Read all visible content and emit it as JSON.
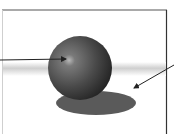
{
  "diagram": {
    "elements": [
      {
        "id": "sphere",
        "label": "",
        "type": "shaded sphere"
      },
      {
        "id": "shadow",
        "label": "",
        "type": "cast shadow"
      },
      {
        "id": "arrow-highlight",
        "points_to": "sphere highlight",
        "label": ""
      },
      {
        "id": "arrow-shadow",
        "points_to": "shadow",
        "label": ""
      }
    ],
    "colors": {
      "background": "#ffffff",
      "sphere_dark": "#2a2a2a",
      "sphere_mid": "#5a5a5a",
      "highlight": "#bdbdbd",
      "shadow": "#585858",
      "frame_right": "#333333",
      "frame_left": "#cfcfcf",
      "arrow": "#222222"
    }
  }
}
